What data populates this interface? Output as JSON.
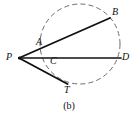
{
  "figure": {
    "caption": "(b)",
    "type": "geometry-diagram",
    "background_color": "#ffffff",
    "stroke_color": "#111111",
    "dashed_stroke_color": "#6b6b6b"
  },
  "circle": {
    "center_x": 80,
    "center_y": 44,
    "radius": 40,
    "style": "dashed"
  },
  "points": {
    "P": {
      "label": "P",
      "x": 19,
      "y": 58,
      "label_x": 6,
      "label_y": 52
    },
    "A": {
      "label": "A",
      "x": 46,
      "y": 47,
      "label_x": 36,
      "label_y": 37
    },
    "B": {
      "label": "B",
      "x": 110,
      "y": 18,
      "label_x": 112,
      "label_y": 7
    },
    "C": {
      "label": "C",
      "x": 46,
      "y": 58,
      "label_x": 50,
      "label_y": 56
    },
    "D": {
      "label": "D",
      "x": 120,
      "y": 58,
      "label_x": 122,
      "label_y": 52
    },
    "T": {
      "label": "T",
      "x": 67,
      "y": 84,
      "label_x": 64,
      "label_y": 85
    }
  },
  "segments": [
    {
      "name": "secant-PAB",
      "from": "P",
      "to": "B",
      "style": "solid"
    },
    {
      "name": "secant-PCD",
      "from": "P",
      "to": "D",
      "style": "solid"
    },
    {
      "name": "tangent-PT",
      "from": "P",
      "to": "T",
      "style": "solid"
    }
  ]
}
